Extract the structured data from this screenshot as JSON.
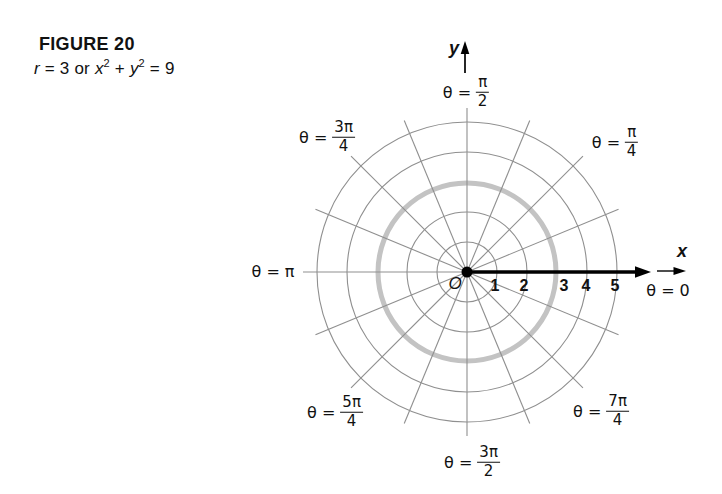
{
  "caption": {
    "figure_label": "FIGURE 20",
    "equation_segments": [
      {
        "text": "r",
        "italic": true
      },
      {
        "text": " = 3 or "
      },
      {
        "text": "x",
        "italic": true
      },
      {
        "text": "2",
        "sup": true
      },
      {
        "text": " + "
      },
      {
        "text": "y",
        "italic": true
      },
      {
        "text": "2",
        "sup": true
      },
      {
        "text": " = 9"
      }
    ]
  },
  "axes": {
    "x_label": "x",
    "y_label": "y",
    "origin_label": "O",
    "tick_labels": [
      "1",
      "2",
      "3",
      "4",
      "5"
    ]
  },
  "theta_labels": [
    {
      "id": "pi-2",
      "prefix": "θ =",
      "num": "π",
      "den": "2"
    },
    {
      "id": "pi-4",
      "prefix": "θ =",
      "num": "π",
      "den": "4"
    },
    {
      "id": "3pi-4",
      "prefix": "θ =",
      "num": "3π",
      "den": "4"
    },
    {
      "id": "pi",
      "prefix": "θ =",
      "plain": "π"
    },
    {
      "id": "zero",
      "prefix": "θ =",
      "plain": "0"
    },
    {
      "id": "5pi-4",
      "prefix": "θ =",
      "num": "5π",
      "den": "4"
    },
    {
      "id": "3pi-2",
      "prefix": "θ =",
      "num": "3π",
      "den": "2"
    },
    {
      "id": "7pi-4",
      "prefix": "θ =",
      "num": "7π",
      "den": "4"
    }
  ],
  "chart_data": {
    "type": "line",
    "coordinate_system": "polar",
    "title": "FIGURE 20",
    "subtitle": "r = 3 or x² + y² = 9",
    "series": [
      {
        "name": "r = 3",
        "polar_equation": "r = 3",
        "cartesian_equation": "x² + y² = 9",
        "r_constant": 3,
        "color": "#c3c3c3"
      }
    ],
    "grid": {
      "on": true,
      "ring_radii": [
        1,
        2,
        3,
        4,
        5
      ],
      "spoke_count": 16,
      "spoke_step_deg": 22.5,
      "color": "#8f8f8f"
    },
    "r_max": 5,
    "x_ticks": [
      1,
      2,
      3,
      4,
      5
    ],
    "angle_labels": [
      "θ = 0",
      "θ = π/4",
      "θ = π/2",
      "θ = 3π/4",
      "θ = π",
      "θ = 5π/4",
      "θ = 3π/2",
      "θ = 7π/4"
    ],
    "axis_labels": {
      "x": "x",
      "y": "y",
      "origin": "O"
    },
    "colors": {
      "axis": "#000000",
      "grid": "#8f8f8f",
      "curve": "#c3c3c3",
      "text": "#111111"
    }
  }
}
